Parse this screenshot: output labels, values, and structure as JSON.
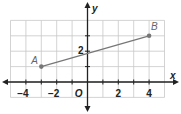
{
  "chart_data": {
    "type": "line",
    "title": "",
    "xlabel": "x",
    "ylabel": "y",
    "origin_label": "O",
    "xlim": [
      -5,
      5
    ],
    "ylim": [
      -1,
      4
    ],
    "grid": true,
    "x_tick_labels": [
      "-4",
      "-2",
      "2",
      "4"
    ],
    "x_ticks": [
      -4,
      -3,
      -2,
      -1,
      1,
      2,
      3,
      4
    ],
    "y_tick_labels": [
      "2"
    ],
    "y_ticks": [
      1,
      2,
      3
    ],
    "points": [
      {
        "label": "A",
        "x": -3,
        "y": 1
      },
      {
        "label": "B",
        "x": 4,
        "y": 3
      }
    ],
    "segment": {
      "from": "A",
      "to": "B"
    },
    "colors": {
      "grid": "#c8c8c8",
      "axis": "#222222",
      "segment": "#777777",
      "point": "#777777"
    }
  }
}
